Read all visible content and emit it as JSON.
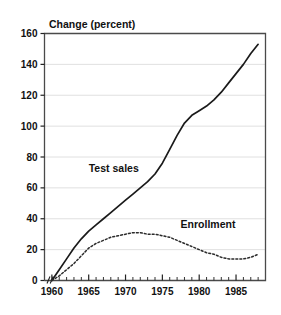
{
  "chart_data": {
    "type": "line",
    "title": "Change (percent)",
    "xlabel": "",
    "ylabel": "Change (percent)",
    "xlim": [
      1959,
      1989
    ],
    "ylim": [
      0,
      160
    ],
    "yticks": [
      0,
      20,
      40,
      60,
      80,
      100,
      120,
      140,
      160
    ],
    "ytick_labels": [
      "0",
      "20",
      "40",
      "60",
      "80",
      "100",
      "120",
      "140",
      "160"
    ],
    "xticks": [
      1960,
      1965,
      1970,
      1975,
      1980,
      1985
    ],
    "xtick_labels": [
      "1960",
      "1965",
      "1970",
      "1975",
      "1980",
      "1985"
    ],
    "minor_xtick_interval": 1,
    "grid": "horizontal",
    "legend_position": "inline-annotations",
    "axis_break": "x-axis break between origin and 1960",
    "series": [
      {
        "name": "Test sales",
        "style": "solid",
        "label_x": 1968.4,
        "label_y": 70,
        "x": [
          1960,
          1961,
          1962,
          1963,
          1964,
          1965,
          1966,
          1967,
          1968,
          1969,
          1970,
          1971,
          1972,
          1973,
          1974,
          1975,
          1976,
          1977,
          1978,
          1979,
          1980,
          1981,
          1982,
          1983,
          1984,
          1985,
          1986,
          1987,
          1988
        ],
        "values": [
          0,
          7,
          14,
          21,
          27,
          32,
          36,
          40,
          44,
          48,
          52,
          56,
          60,
          64,
          69,
          76,
          85,
          94,
          102,
          107,
          110,
          113,
          117,
          122,
          128,
          134,
          140,
          147,
          153
        ]
      },
      {
        "name": "Enrollment",
        "style": "dotted",
        "label_x": 1981.2,
        "label_y": 34,
        "x": [
          1960,
          1961,
          1962,
          1963,
          1964,
          1965,
          1966,
          1967,
          1968,
          1969,
          1970,
          1971,
          1972,
          1973,
          1974,
          1975,
          1976,
          1977,
          1978,
          1979,
          1980,
          1981,
          1982,
          1983,
          1984,
          1985,
          1986,
          1987,
          1988
        ],
        "values": [
          0,
          3,
          7,
          11,
          16,
          21,
          24,
          26,
          28,
          29,
          30,
          31,
          31,
          30,
          30,
          29,
          28,
          26,
          24,
          22,
          20,
          18,
          17,
          15,
          14,
          14,
          14,
          15,
          17
        ]
      }
    ]
  },
  "labels": {
    "title": "Change (percent)",
    "series_test_sales": "Test sales",
    "series_enrollment": "Enrollment"
  }
}
